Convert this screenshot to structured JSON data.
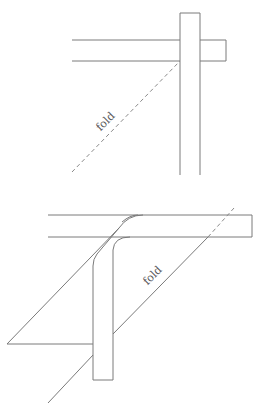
{
  "figure": {
    "top_diagram": {
      "fold_label": "fold",
      "description": "Two crossing strips with a dashed diagonal fold line before folding"
    },
    "bottom_diagram": {
      "fold_label": "fold",
      "description": "Horizontal strip folded down along the diagonal fold line, forming an elbow"
    }
  },
  "colors": {
    "line": "#7a7a7a",
    "background": "#ffffff"
  }
}
